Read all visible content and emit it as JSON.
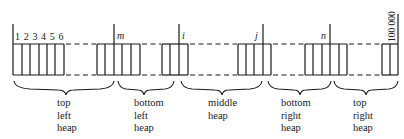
{
  "diagram": {
    "type": "array-partition-into-heaps",
    "index_labels": {
      "start": "1 2 3 4 5 6",
      "m": "m",
      "i": "i",
      "j": "j",
      "n": "n",
      "end": "100 000"
    },
    "regions": [
      {
        "name": "top-left-heap",
        "lines": [
          "top",
          "left",
          "heap"
        ]
      },
      {
        "name": "bottom-left-heap",
        "lines": [
          "bottom",
          "left",
          "heap"
        ]
      },
      {
        "name": "middle-heap",
        "lines": [
          "middle",
          "heap"
        ]
      },
      {
        "name": "bottom-right-heap",
        "lines": [
          "bottom",
          "right",
          "heap"
        ]
      },
      {
        "name": "top-right-heap",
        "lines": [
          "top",
          "right",
          "heap"
        ]
      }
    ],
    "colors": {
      "line": "#1a1a1a",
      "background": "#ffffff"
    }
  }
}
